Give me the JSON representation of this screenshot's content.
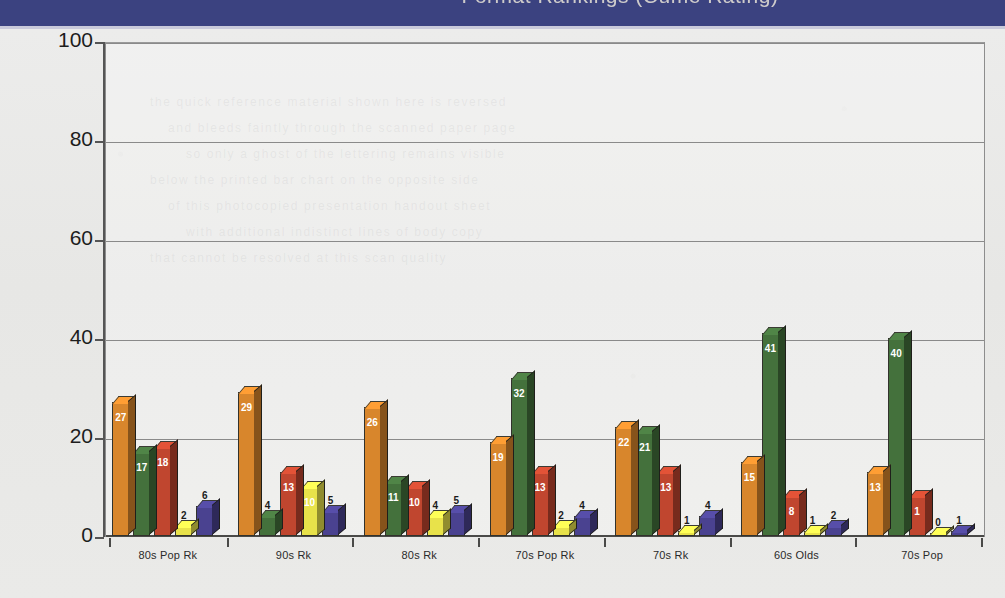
{
  "header": {
    "title": "Format Rankings (Cume Rating)"
  },
  "axis": {
    "y_ticks": [
      "0",
      "20",
      "40",
      "60",
      "80",
      "100"
    ],
    "x_labels": [
      "80s Pop Rk",
      "90s Rk",
      "80s Rk",
      "70s Pop Rk",
      "70s Rk",
      "60s Olds",
      "70s Pop"
    ]
  },
  "bleed_text": [
    "the quick reference material shown here is reversed",
    "and bleeds faintly through the scanned paper page",
    "so only a ghost of the lettering remains visible",
    "below the printed bar chart on the opposite side",
    "of this photocopied presentation handout sheet",
    "with additional indistinct lines of body copy",
    "that cannot be resolved at this scan quality"
  ],
  "chart_data": {
    "type": "bar",
    "title": "Format Rankings (Cume Rating)",
    "xlabel": "",
    "ylabel": "",
    "ylim": [
      0,
      100
    ],
    "ytick_step": 20,
    "grid": true,
    "legend": "none",
    "categories": [
      "80s Pop Rk",
      "90s Rk",
      "80s Rk",
      "70s Pop Rk",
      "70s Rk",
      "60s Olds",
      "70s Pop"
    ],
    "series": [
      {
        "name": "Series 1",
        "color": "#d8862c",
        "values": [
          27,
          29,
          26,
          19,
          22,
          15,
          13
        ]
      },
      {
        "name": "Series 2",
        "color": "#44713c",
        "values": [
          17,
          4,
          11,
          32,
          21,
          41,
          40
        ]
      },
      {
        "name": "Series 3",
        "color": "#c0462f",
        "values": [
          18,
          13,
          10,
          13,
          13,
          8,
          8
        ]
      },
      {
        "name": "Series 4",
        "color": "#e8e24a",
        "values": [
          2,
          10,
          4,
          2,
          1,
          1,
          0
        ]
      },
      {
        "name": "Series 5",
        "color": "#4a4290",
        "values": [
          6,
          5,
          5,
          4,
          4,
          2,
          1
        ]
      }
    ],
    "data_labels": [
      [
        "27",
        "17",
        "18",
        "2",
        "6"
      ],
      [
        "29",
        "4",
        "13",
        "10",
        "5"
      ],
      [
        "26",
        "11",
        "10",
        "4",
        "5"
      ],
      [
        "19",
        "32",
        "13",
        "2",
        "4"
      ],
      [
        "22",
        "21",
        "13",
        "1",
        "4"
      ],
      [
        "15",
        "41",
        "8",
        "1",
        "2"
      ],
      [
        "13",
        "40",
        "1",
        "0",
        "1"
      ]
    ]
  }
}
